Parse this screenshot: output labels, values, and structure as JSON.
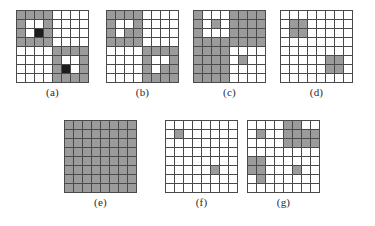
{
  "figure": {
    "background": "#ffffff",
    "grid_line_color": "#4a4a4a",
    "colors": {
      "white": "#ffffff",
      "gray": "#9b9b9b",
      "black": "#1c1c1c"
    },
    "rows": 8,
    "cols": 8,
    "panels": [
      {
        "id": "a",
        "label": "(a)",
        "left": 16,
        "top": 10,
        "cell": 8,
        "cells": [
          [
            "g",
            "g",
            "g",
            "g",
            "w",
            "w",
            "w",
            "w"
          ],
          [
            "g",
            "w",
            "w",
            "g",
            "w",
            "w",
            "w",
            "w"
          ],
          [
            "g",
            "w",
            "k",
            "g",
            "w",
            "w",
            "w",
            "w"
          ],
          [
            "g",
            "g",
            "g",
            "g",
            "w",
            "w",
            "w",
            "w"
          ],
          [
            "w",
            "w",
            "w",
            "w",
            "g",
            "g",
            "g",
            "g"
          ],
          [
            "w",
            "w",
            "w",
            "w",
            "g",
            "w",
            "w",
            "g"
          ],
          [
            "w",
            "w",
            "w",
            "w",
            "g",
            "k",
            "w",
            "g"
          ],
          [
            "w",
            "w",
            "w",
            "w",
            "g",
            "g",
            "g",
            "g"
          ]
        ]
      },
      {
        "id": "b",
        "label": "(b)",
        "left": 106,
        "top": 10,
        "cell": 8,
        "cells": [
          [
            "g",
            "g",
            "g",
            "g",
            "w",
            "w",
            "w",
            "w"
          ],
          [
            "g",
            "w",
            "w",
            "g",
            "w",
            "w",
            "w",
            "w"
          ],
          [
            "g",
            "w",
            "g",
            "g",
            "w",
            "w",
            "w",
            "w"
          ],
          [
            "g",
            "g",
            "g",
            "g",
            "w",
            "w",
            "w",
            "w"
          ],
          [
            "w",
            "w",
            "w",
            "w",
            "g",
            "g",
            "g",
            "g"
          ],
          [
            "w",
            "w",
            "w",
            "w",
            "g",
            "w",
            "w",
            "g"
          ],
          [
            "w",
            "w",
            "w",
            "w",
            "g",
            "w",
            "g",
            "g"
          ],
          [
            "w",
            "w",
            "w",
            "w",
            "g",
            "g",
            "g",
            "g"
          ]
        ]
      },
      {
        "id": "c",
        "label": "(c)",
        "left": 193,
        "top": 10,
        "cell": 8,
        "cells": [
          [
            "g",
            "w",
            "w",
            "w",
            "g",
            "g",
            "g",
            "g"
          ],
          [
            "g",
            "w",
            "g",
            "w",
            "g",
            "g",
            "g",
            "g"
          ],
          [
            "g",
            "w",
            "w",
            "w",
            "g",
            "g",
            "g",
            "g"
          ],
          [
            "g",
            "g",
            "g",
            "g",
            "g",
            "g",
            "g",
            "g"
          ],
          [
            "g",
            "g",
            "g",
            "g",
            "w",
            "w",
            "w",
            "w"
          ],
          [
            "g",
            "g",
            "g",
            "g",
            "w",
            "g",
            "w",
            "w"
          ],
          [
            "g",
            "g",
            "g",
            "g",
            "w",
            "w",
            "w",
            "w"
          ],
          [
            "g",
            "g",
            "g",
            "g",
            "w",
            "w",
            "w",
            "w"
          ]
        ]
      },
      {
        "id": "d",
        "label": "(d)",
        "left": 280,
        "top": 10,
        "cell": 8,
        "cells": [
          [
            "w",
            "w",
            "w",
            "w",
            "w",
            "w",
            "w",
            "w"
          ],
          [
            "w",
            "g",
            "g",
            "w",
            "w",
            "w",
            "w",
            "w"
          ],
          [
            "w",
            "g",
            "g",
            "w",
            "w",
            "w",
            "w",
            "w"
          ],
          [
            "w",
            "w",
            "w",
            "w",
            "w",
            "w",
            "w",
            "w"
          ],
          [
            "w",
            "w",
            "w",
            "w",
            "w",
            "w",
            "w",
            "w"
          ],
          [
            "w",
            "w",
            "w",
            "w",
            "w",
            "g",
            "g",
            "w"
          ],
          [
            "w",
            "w",
            "w",
            "w",
            "w",
            "g",
            "g",
            "w"
          ],
          [
            "w",
            "w",
            "w",
            "w",
            "w",
            "w",
            "w",
            "w"
          ]
        ]
      },
      {
        "id": "e",
        "label": "(e)",
        "left": 64,
        "top": 120,
        "cell": 8,
        "cells": [
          [
            "g",
            "g",
            "g",
            "g",
            "g",
            "g",
            "g",
            "g"
          ],
          [
            "g",
            "g",
            "g",
            "g",
            "g",
            "g",
            "g",
            "g"
          ],
          [
            "g",
            "g",
            "g",
            "g",
            "g",
            "g",
            "g",
            "g"
          ],
          [
            "g",
            "g",
            "g",
            "g",
            "g",
            "g",
            "g",
            "g"
          ],
          [
            "g",
            "g",
            "g",
            "g",
            "g",
            "g",
            "g",
            "g"
          ],
          [
            "g",
            "g",
            "g",
            "g",
            "g",
            "g",
            "g",
            "g"
          ],
          [
            "g",
            "g",
            "g",
            "g",
            "g",
            "g",
            "g",
            "g"
          ],
          [
            "g",
            "g",
            "g",
            "g",
            "g",
            "g",
            "g",
            "g"
          ]
        ]
      },
      {
        "id": "f",
        "label": "(f)",
        "left": 165,
        "top": 120,
        "cell": 8,
        "cells": [
          [
            "w",
            "w",
            "w",
            "w",
            "w",
            "w",
            "w",
            "w"
          ],
          [
            "w",
            "g",
            "w",
            "w",
            "w",
            "w",
            "w",
            "w"
          ],
          [
            "w",
            "w",
            "w",
            "w",
            "w",
            "w",
            "w",
            "w"
          ],
          [
            "w",
            "w",
            "w",
            "w",
            "w",
            "w",
            "w",
            "w"
          ],
          [
            "w",
            "w",
            "w",
            "w",
            "w",
            "w",
            "w",
            "w"
          ],
          [
            "w",
            "w",
            "w",
            "w",
            "w",
            "g",
            "w",
            "w"
          ],
          [
            "w",
            "w",
            "w",
            "w",
            "w",
            "w",
            "w",
            "w"
          ],
          [
            "w",
            "w",
            "w",
            "w",
            "w",
            "w",
            "w",
            "w"
          ]
        ]
      },
      {
        "id": "g",
        "label": "(g)",
        "left": 247,
        "top": 120,
        "cell": 8,
        "cells": [
          [
            "w",
            "w",
            "w",
            "w",
            "g",
            "g",
            "w",
            "w"
          ],
          [
            "w",
            "g",
            "w",
            "w",
            "g",
            "g",
            "g",
            "g"
          ],
          [
            "w",
            "w",
            "w",
            "w",
            "g",
            "g",
            "g",
            "g"
          ],
          [
            "w",
            "w",
            "w",
            "w",
            "w",
            "w",
            "w",
            "w"
          ],
          [
            "g",
            "g",
            "w",
            "w",
            "w",
            "w",
            "w",
            "w"
          ],
          [
            "g",
            "g",
            "w",
            "w",
            "w",
            "g",
            "w",
            "w"
          ],
          [
            "w",
            "g",
            "w",
            "w",
            "w",
            "w",
            "w",
            "w"
          ],
          [
            "w",
            "w",
            "w",
            "w",
            "w",
            "w",
            "w",
            "w"
          ]
        ]
      }
    ]
  }
}
